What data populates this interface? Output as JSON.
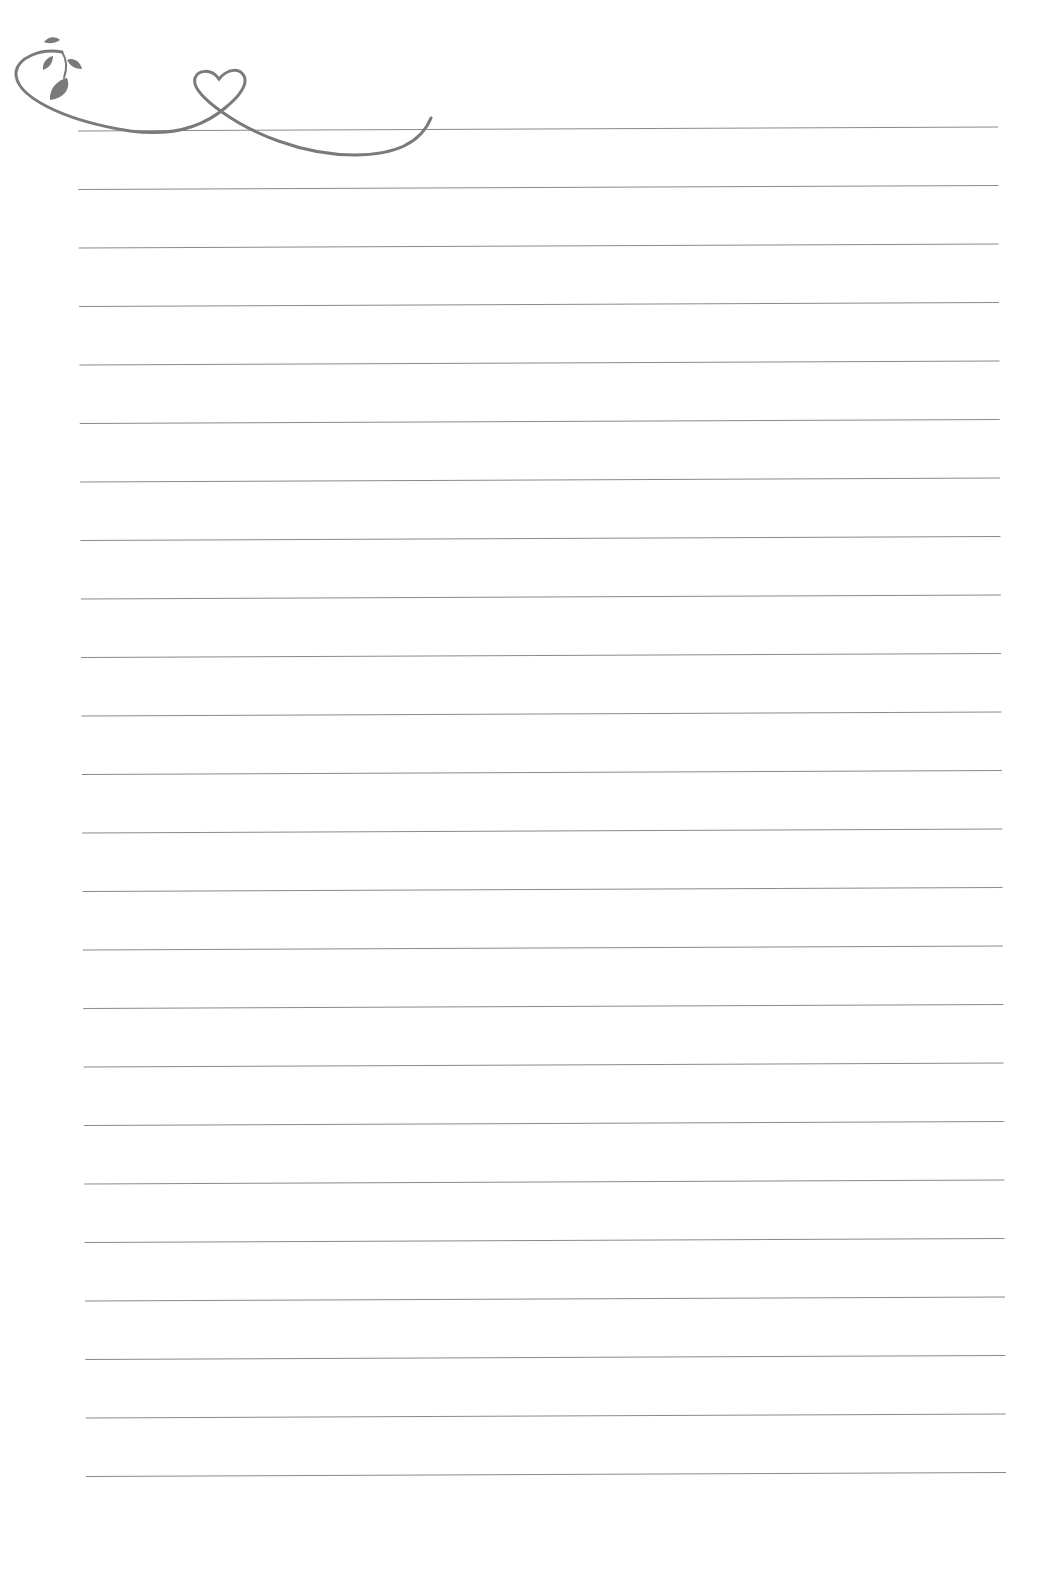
{
  "page": {
    "type": "lined stationery",
    "background": "#ffffff",
    "line_color": "#8a8a8a",
    "ornament_color": "#7a7a7a",
    "line_count": 24,
    "first_line_y": 127,
    "line_spacing": 58.5,
    "line_left_x": 78,
    "line_right_x": 998
  },
  "ornament": {
    "description": "vine swirl with leaves and a heart loop",
    "icons": [
      "vine-icon",
      "leaf-icon",
      "heart-icon"
    ]
  }
}
